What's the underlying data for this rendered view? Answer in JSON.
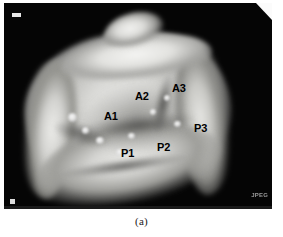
{
  "figure": {
    "caption": "(a)",
    "modality_marker_top_left": "3D",
    "watermark": "JPEG"
  },
  "annotations": {
    "labels": [
      {
        "id": "A1",
        "text": "A1",
        "anatomy": "anterior-leaflet-scallop-1"
      },
      {
        "id": "A2",
        "text": "A2",
        "anatomy": "anterior-leaflet-scallop-2"
      },
      {
        "id": "A3",
        "text": "A3",
        "anatomy": "anterior-leaflet-scallop-3"
      },
      {
        "id": "P1",
        "text": "P1",
        "anatomy": "posterior-leaflet-scallop-1"
      },
      {
        "id": "P2",
        "text": "P2",
        "anatomy": "posterior-leaflet-scallop-2"
      },
      {
        "id": "P3",
        "text": "P3",
        "anatomy": "posterior-leaflet-scallop-3"
      }
    ]
  },
  "colors": {
    "panel_background": "#050505",
    "page_background": "#ffffff",
    "label_text": "#000000",
    "watermark_text": "#9a9a9a",
    "corner_fold": "#fbfbfb",
    "tissue_highlight": "#f4f4f2",
    "tissue_midtone": "#bdbdba",
    "tissue_shadow": "#3a3a39"
  }
}
